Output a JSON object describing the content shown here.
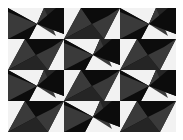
{
  "image": {
    "description": "Black, white and gray geometric tessellation of triangular pinwheel tiles",
    "grid": {
      "columns": 3,
      "rows": 4
    },
    "tile_size": {
      "width": 56,
      "height": 31
    },
    "tile_types": [
      "A",
      "B"
    ],
    "layout": [
      [
        "A",
        "B",
        "A"
      ],
      [
        "B",
        "A",
        "B"
      ],
      [
        "A",
        "B",
        "A"
      ],
      [
        "B",
        "A",
        "B"
      ]
    ],
    "colors": {
      "white": "#f2f2f2",
      "black": "#0c0c0c",
      "dark_gray": "#252525",
      "gray": "#3a3a3a",
      "background": "#ffffff"
    }
  }
}
